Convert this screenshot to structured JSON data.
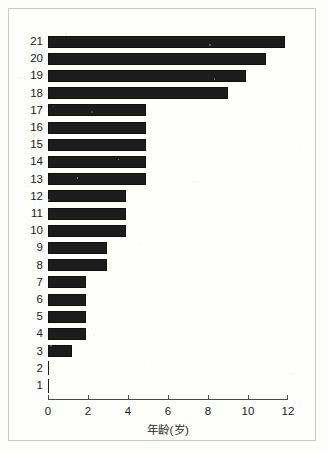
{
  "chart_data": {
    "type": "bar",
    "orientation": "horizontal",
    "title": "",
    "subtitle": "",
    "xlabel": "年龄(岁)",
    "ylabel": "",
    "xlim": [
      0,
      12
    ],
    "ylim": [
      0,
      22
    ],
    "grid": false,
    "legend": null,
    "bar_color": "#1c1c1c",
    "xticks": [
      0,
      2,
      4,
      6,
      8,
      10,
      12
    ],
    "xticklabels": [
      "0",
      "2",
      "4",
      "6",
      "8",
      "10",
      "12"
    ],
    "categories": [
      "21",
      "20",
      "19",
      "18",
      "17",
      "16",
      "15",
      "14",
      "13",
      "12",
      "11",
      "10",
      "9",
      "8",
      "7",
      "6",
      "5",
      "4",
      "3",
      "2",
      "1"
    ],
    "values": [
      11.85,
      10.9,
      9.9,
      9.0,
      4.9,
      4.9,
      4.9,
      4.9,
      4.9,
      3.9,
      3.9,
      3.9,
      2.95,
      2.95,
      1.9,
      1.9,
      1.9,
      1.9,
      1.2,
      0,
      0
    ]
  },
  "figure": {
    "background_color": "#fdfdfc",
    "frame_color": "#c8c8c4",
    "axis_color": "#4a4a4a",
    "text_color": "#23211f"
  }
}
